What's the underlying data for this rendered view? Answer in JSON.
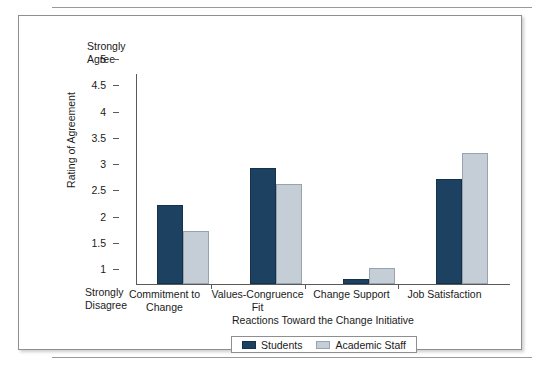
{
  "figure": {
    "frame_border_color": "#8f8f8f",
    "background": "#ffffff"
  },
  "anchors": {
    "top_label": "Strongly\nAgree",
    "top_label_line1": "Strongly",
    "top_label_line2": "Agree",
    "bottom_label_line1": "Strongly",
    "bottom_label_line2": "Disagree"
  },
  "legend": {
    "entries": [
      {
        "label": "Students",
        "color": "#1d4160"
      },
      {
        "label": "Academic Staff",
        "color": "#c5ced6"
      }
    ]
  },
  "chart_data": {
    "type": "bar",
    "title": "",
    "xlabel": "Reactions Toward the Change Initiative",
    "ylabel": "Rating of Agreement",
    "ylim": [
      1,
      5
    ],
    "yticks": [
      1,
      1.5,
      2,
      2.5,
      3,
      3.5,
      4,
      4.5,
      5
    ],
    "ytick_labels": [
      "1",
      "1.5",
      "2",
      "2.5",
      "3",
      "3.5",
      "4",
      "4.5",
      "5"
    ],
    "y_axis_low_anchor": "Strongly Disagree",
    "y_axis_high_anchor": "Strongly Agree",
    "grid": false,
    "legend_position": "bottom",
    "categories": [
      "Commitment to Change",
      "Values-Congruence Fit",
      "Change Support",
      "Job Satisfaction"
    ],
    "category_label_lines": [
      [
        "Commitment to",
        "Change"
      ],
      [
        "Values-Congruence",
        "Fit"
      ],
      [
        "Change Support",
        ""
      ],
      [
        "Job Satisfaction",
        ""
      ]
    ],
    "series": [
      {
        "name": "Students",
        "color": "#1d4160",
        "values": [
          2.5,
          3.2,
          1.1,
          3.0
        ]
      },
      {
        "name": "Academic Staff",
        "color": "#c5ced6",
        "values": [
          2.0,
          2.9,
          1.3,
          3.5
        ]
      }
    ]
  }
}
